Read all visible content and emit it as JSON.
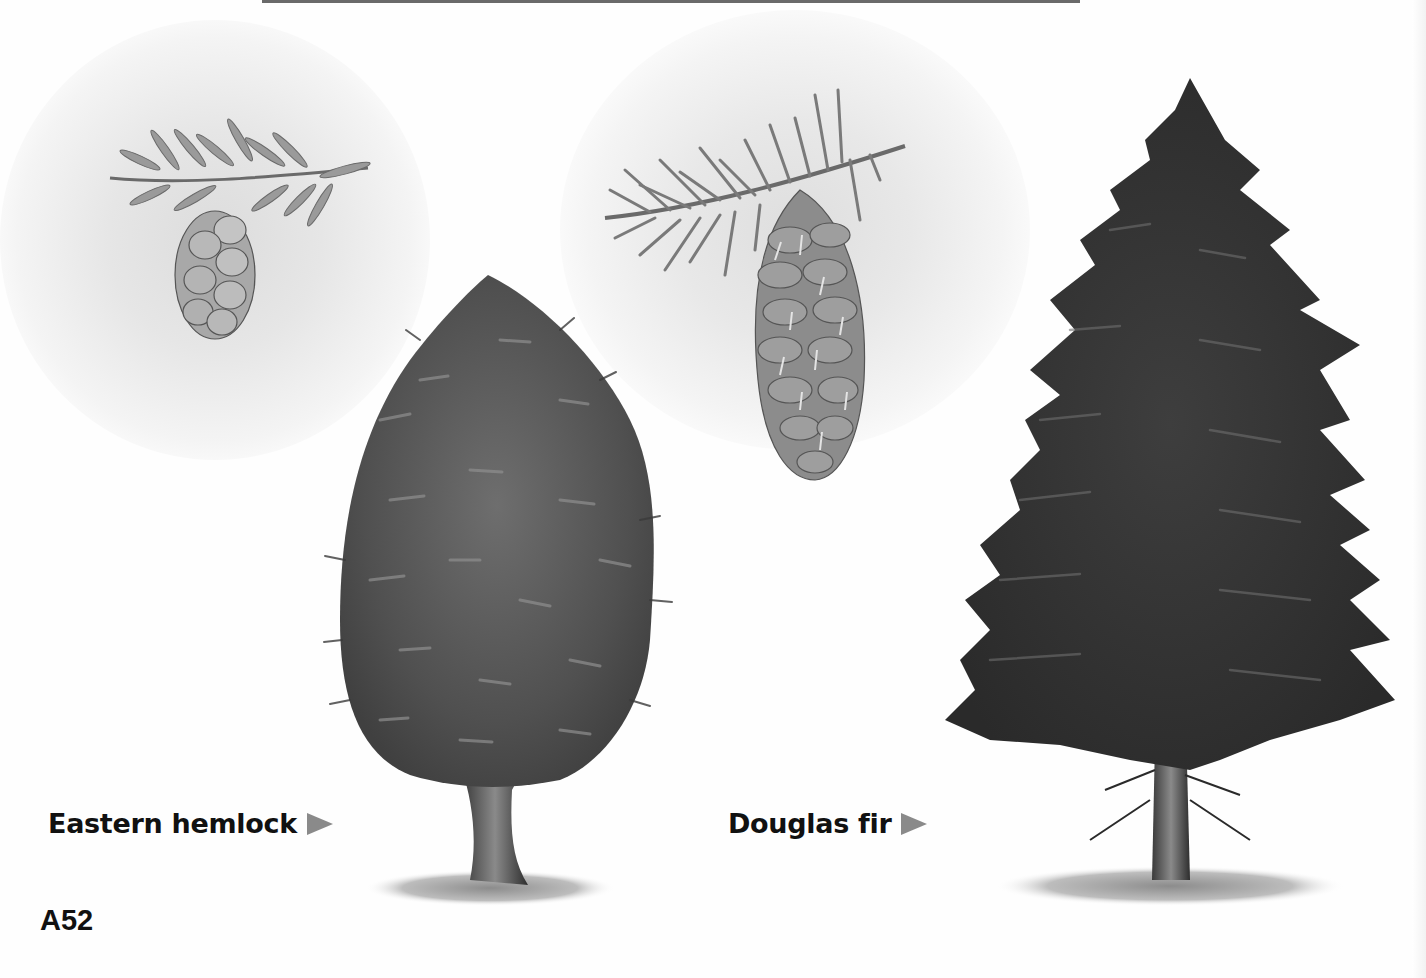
{
  "page": {
    "page_number": "A52",
    "background": "#ffffff",
    "ink_color": "#111111",
    "arrow_color": "#8a8a8a"
  },
  "illustrations": [
    {
      "id": "eastern-hemlock-branch",
      "description": "Eastern hemlock branch sprig with small hanging cone",
      "icon": "branch-with-small-cone"
    },
    {
      "id": "douglas-fir-branch",
      "description": "Douglas fir branch sprig with long hanging cone with three-pointed bracts",
      "icon": "branch-with-long-cone"
    },
    {
      "id": "eastern-hemlock-tree",
      "description": "Eastern hemlock tree, broad rounded-conical crown with forked trunk",
      "icon": "conifer-tree-rounded"
    },
    {
      "id": "douglas-fir-tree",
      "description": "Douglas fir tree, tall narrow conical crown with straight trunk",
      "icon": "conifer-tree-tall"
    }
  ],
  "labels": {
    "eastern_hemlock": "Eastern hemlock",
    "douglas_fir": "Douglas fir",
    "pointer_icon": "right-triangle-arrow"
  }
}
